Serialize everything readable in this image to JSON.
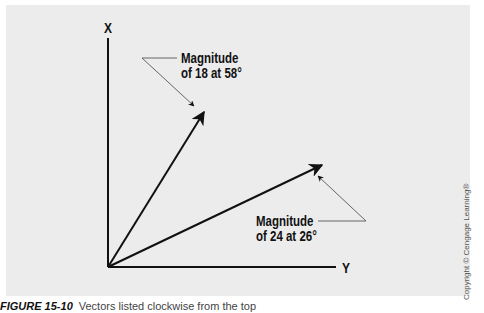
{
  "figure": {
    "caption_label": "FIGURE 15-10",
    "caption_text": "Vectors listed clockwise from the top",
    "copyright": "Copyright © Cengage Learning®"
  },
  "axes": {
    "vertical_label": "X",
    "horizontal_label": "Y"
  },
  "vectors": [
    {
      "name": "vector-1",
      "magnitude": 18,
      "angle_deg": 58,
      "label_line1": "Magnitude",
      "label_line2": "of 18 at 58°"
    },
    {
      "name": "vector-2",
      "magnitude": 24,
      "angle_deg": 26,
      "label_line1": "Magnitude",
      "label_line2": "of 24 at 26°"
    }
  ],
  "colors": {
    "panel": "#ececec",
    "ink": "#111111",
    "leader": "#666666"
  }
}
